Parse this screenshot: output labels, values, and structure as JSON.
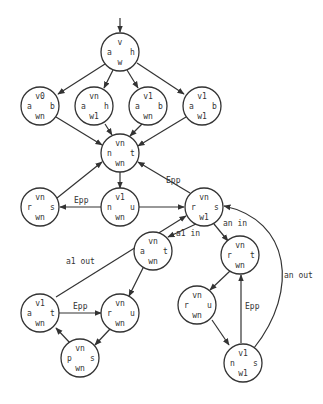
{
  "diagram": {
    "type": "state-graph",
    "nodes": [
      {
        "id": "n0",
        "top": "v",
        "left": "a",
        "right": "h",
        "bottom": "w"
      },
      {
        "id": "n1",
        "top": "v0",
        "left": "a",
        "right": "b",
        "bottom": "wn"
      },
      {
        "id": "n2",
        "top": "vn",
        "left": "a",
        "right": "h",
        "bottom": "w1"
      },
      {
        "id": "n3",
        "top": "v1",
        "left": "a",
        "right": "b",
        "bottom": "wn"
      },
      {
        "id": "n4",
        "top": "v1",
        "left": "a",
        "right": "b",
        "bottom": "w1"
      },
      {
        "id": "n5",
        "top": "vn",
        "left": "n",
        "right": "t",
        "bottom": "wn"
      },
      {
        "id": "n6",
        "top": "vn",
        "left": "r",
        "right": "s",
        "bottom": "wn"
      },
      {
        "id": "n7",
        "top": "v1",
        "left": "n",
        "right": "u",
        "bottom": "wn"
      },
      {
        "id": "n8",
        "top": "vn",
        "left": "r",
        "right": "s",
        "bottom": "w1"
      },
      {
        "id": "n9",
        "top": "vn",
        "left": "a",
        "right": "t",
        "bottom": "wn"
      },
      {
        "id": "n10",
        "top": "vn",
        "left": "r",
        "right": "t",
        "bottom": "wn"
      },
      {
        "id": "n11",
        "top": "v1",
        "left": "a",
        "right": "t",
        "bottom": "wn"
      },
      {
        "id": "n12",
        "top": "vn",
        "left": "r",
        "right": "u",
        "bottom": "wn"
      },
      {
        "id": "n13",
        "top": "vn",
        "left": "p",
        "right": "s",
        "bottom": "wn"
      },
      {
        "id": "n14",
        "top": "vn",
        "left": "r",
        "right": "u",
        "bottom": "wn"
      },
      {
        "id": "n15",
        "top": "v1",
        "left": "n",
        "right": "s",
        "bottom": "w1"
      }
    ],
    "edge_labels": {
      "epp_n8_n5": "Epp",
      "epp_n7_n6": "Epp",
      "a1_in": "a1 in",
      "an_in": "an in",
      "a1_out": "a1 out",
      "an_out": "an out",
      "epp_n11_n12": "Epp",
      "epp_n15_n10": "Epp"
    }
  }
}
